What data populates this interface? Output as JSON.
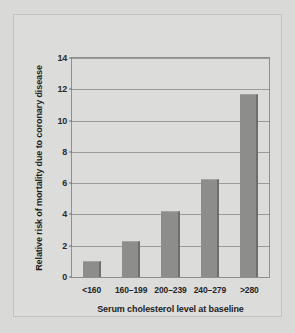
{
  "chart_data": {
    "type": "bar",
    "title": "",
    "subtitle": "",
    "xlabel": "Serum cholesterol level at baseline",
    "ylabel": "Relative risk of mortality due to coronary disease",
    "categories": [
      "<160",
      "160–199",
      "200–239",
      "240–279",
      ">280"
    ],
    "values": [
      1.0,
      2.3,
      4.25,
      6.25,
      11.7
    ],
    "series": [
      {
        "name": "Relative risk of mortality",
        "values": [
          1.0,
          2.3,
          4.25,
          6.25,
          11.7
        ]
      }
    ],
    "ylim": [
      0,
      14
    ],
    "xlim": [
      0,
      5
    ],
    "yticks": [
      0,
      2,
      4,
      6,
      8,
      10,
      12,
      14
    ],
    "ytick_labels": [
      "0",
      "2",
      "4",
      "6",
      "8",
      "10",
      "12",
      "14"
    ],
    "grid": true,
    "grid_axis": "y",
    "legend": false,
    "legend_position": "none",
    "bar_color": "#8d8d8b",
    "bar_edge_color": "#6e6e6c",
    "grid_color": "#9b9b99",
    "axis_color": "#8f8f8d",
    "background_color": "#d9d9d7",
    "panel_color": "#dcdcda",
    "text_color": "#1d1d1d",
    "annotations": []
  }
}
